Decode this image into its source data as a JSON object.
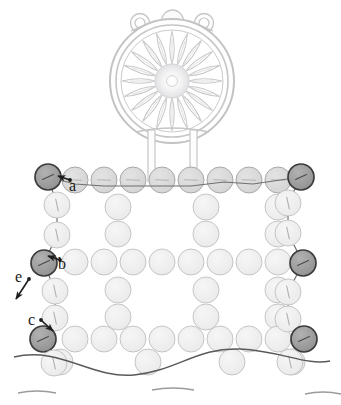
{
  "figure": {
    "type": "line-diagram",
    "background": "#ffffff",
    "ink_color": "#3b3b3b",
    "ground_line_color": "#555555"
  },
  "palette": {
    "node_light_fill": "#ececed",
    "node_light_stroke": "#b9b9ba",
    "node_mid_fill": "#d8d8d8",
    "node_mid_stroke": "#a3a3a3",
    "node_dark_fill": "#9a9a9a",
    "node_dark_stroke": "#3c3c3c",
    "medallion_stroke": "#c4c4c6",
    "medallion_fill": "#fdfdfd",
    "label_color": "#1a1a1a",
    "arrow_color": "#1d1d1d"
  },
  "medallion": {
    "name": "rose-window",
    "center_x": 172,
    "center_y": 80,
    "outer_radius": 62,
    "inner_ring_radius": 56,
    "petal_count": 20,
    "hub_radius": 16,
    "hub_glyph": "o",
    "finials": [
      {
        "name": "finial-left",
        "cx": 140,
        "cy": 22,
        "r": 9,
        "inner_r": 5
      },
      {
        "name": "finial-right",
        "cx": 204,
        "cy": 22,
        "r": 9,
        "inner_r": 5
      }
    ],
    "crown": {
      "name": "crown-arch",
      "cx": 172,
      "cy": 20,
      "rx": 11,
      "ry": 14
    },
    "legs": [
      {
        "name": "support-leg-left",
        "x": 152,
        "y_top": 128,
        "y_bottom": 180,
        "width": 6
      },
      {
        "name": "support-leg-right",
        "x": 194,
        "y_top": 128,
        "y_bottom": 180,
        "width": 6
      }
    ]
  },
  "lattice": {
    "node_radius": 13,
    "col_step": 29.6,
    "row_step": 27.5,
    "left_edge_x": 45,
    "right_edge_x": 302,
    "top_row_y": 180,
    "rows": 7,
    "cols": 9,
    "description": "staggered grid of pale circular nodes framed by darker boundary chains on the left and right edges"
  },
  "highlighted_nodes": [
    {
      "id": "n-tl",
      "label_ref": "a",
      "cx": 48,
      "cy": 177,
      "shade": "dark"
    },
    {
      "id": "n-tr",
      "label_ref": "",
      "cx": 301,
      "cy": 177,
      "shade": "dark"
    },
    {
      "id": "n-ml",
      "label_ref": "b",
      "cx": 44,
      "cy": 263,
      "shade": "dark"
    },
    {
      "id": "n-mr",
      "label_ref": "",
      "cx": 303,
      "cy": 263,
      "shade": "dark"
    },
    {
      "id": "n-bl",
      "label_ref": "c",
      "cx": 43,
      "cy": 339,
      "shade": "dark"
    },
    {
      "id": "n-br",
      "label_ref": "",
      "cx": 304,
      "cy": 339,
      "shade": "dark"
    }
  ],
  "annotations": [
    {
      "name": "label-a",
      "text": "a",
      "x": 71,
      "y": 181,
      "arrow": {
        "from": [
          70,
          180
        ],
        "to": [
          58,
          176
        ]
      }
    },
    {
      "name": "label-b",
      "text": "b",
      "x": 60,
      "y": 262,
      "arrow": {
        "from": [
          60,
          260
        ],
        "to": [
          48,
          256
        ]
      }
    },
    {
      "name": "label-c",
      "text": "c",
      "x": 31,
      "y": 319,
      "arrow": {
        "from": [
          41,
          320
        ],
        "to": [
          53,
          331
        ]
      }
    },
    {
      "name": "label-e",
      "text": "e",
      "x": 18,
      "y": 276,
      "arrow": {
        "from": [
          29,
          279
        ],
        "to": [
          16,
          299
        ]
      }
    }
  ],
  "ground": {
    "name": "ground-wave",
    "label": "undulating ground line",
    "y_base": 359,
    "amplitude": 9,
    "wave_count": 2
  },
  "bottom_fragments": {
    "name": "cut-off-arc-row",
    "label": "partial arcs of the next node row",
    "y": 390,
    "count": 3
  }
}
